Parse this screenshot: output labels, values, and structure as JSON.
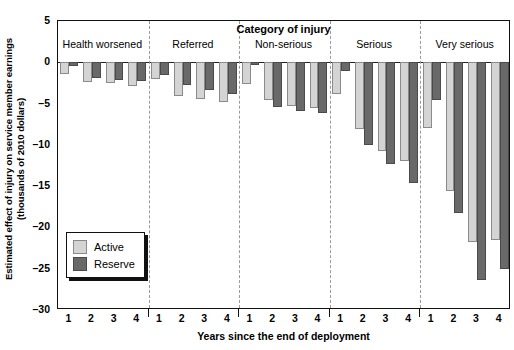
{
  "chart_data": {
    "type": "bar",
    "title": "Category of injury",
    "xlabel": "Years since the end of deployment",
    "ylabel": "Estimated effect of injury on service member earnings (thousands of 2010 dollars)",
    "ylabel_line1": "Estimated effect of injury on service member earnings",
    "ylabel_line2": "(thousands of 2010 dollars)",
    "ylim": [
      -30,
      5
    ],
    "yticks": [
      5,
      0,
      -5,
      -10,
      -15,
      -20,
      -25,
      -30
    ],
    "ytick_labels": [
      "5",
      "0",
      "–5",
      "–10",
      "–15",
      "–20",
      "–25",
      "–30"
    ],
    "grid": false,
    "legend_position": "lower-left-inside",
    "groups": [
      "Health worsened",
      "Referred",
      "Non-serious",
      "Serious",
      "Very serious"
    ],
    "categories": [
      "1",
      "2",
      "3",
      "4"
    ],
    "x_tick_labels": [
      "1",
      "2",
      "3",
      "4",
      "1",
      "2",
      "3",
      "4",
      "1",
      "2",
      "3",
      "4",
      "1",
      "2",
      "3",
      "4",
      "1",
      "2",
      "3",
      "4"
    ],
    "series": [
      {
        "name": "Active",
        "color": "#d4d4d4",
        "values_by_group": {
          "Health worsened": [
            -1.4,
            -2.4,
            -2.5,
            -2.9
          ],
          "Referred": [
            -2.0,
            -4.1,
            -4.5,
            -4.8
          ],
          "Non-serious": [
            -2.6,
            -4.6,
            -5.3,
            -5.5
          ],
          "Serious": [
            -3.9,
            -8.1,
            -10.7,
            -11.9
          ],
          "Very serious": [
            -7.9,
            -15.6,
            -21.8,
            -21.5
          ]
        }
      },
      {
        "name": "Reserve",
        "color": "#696969",
        "values_by_group": {
          "Health worsened": [
            -0.5,
            -1.9,
            -2.1,
            -2.3
          ],
          "Referred": [
            -1.5,
            -2.7,
            -3.3,
            -3.8
          ],
          "Non-serious": [
            -0.3,
            -5.4,
            -5.9,
            -6.1
          ],
          "Serious": [
            -1.0,
            -10.0,
            -12.3,
            -14.6
          ],
          "Very serious": [
            -4.6,
            -18.3,
            -26.4,
            -25.0
          ]
        }
      }
    ]
  },
  "legend": {
    "items": [
      {
        "label": "Active",
        "key": "active"
      },
      {
        "label": "Reserve",
        "key": "reserve"
      }
    ]
  }
}
